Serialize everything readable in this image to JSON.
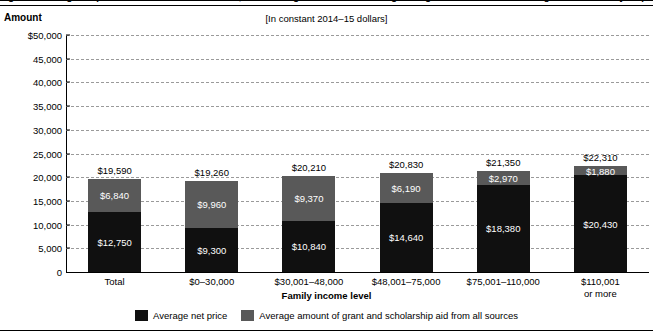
{
  "figure": {
    "title": "Figure 1. Average net price of attendance for first-time, full-time degree/certificate-seeking undergraduate students receiving Title IV aid at 4-year public postsecondary institutions, by family income level: Academic year 2013–14",
    "subtitle": "[In constant 2014–15 dollars]",
    "amount_axis_label": "Amount"
  },
  "chart_data": {
    "type": "bar",
    "stacked": true,
    "title": "Figure 1. Average net price of attendance for first-time, full-time degree/certificate-seeking undergraduate students receiving Title IV aid at 4-year public postsecondary institutions, by family income level: Academic year 2013–14",
    "subtitle": "[In constant 2014–15 dollars]",
    "xlabel": "Family income level",
    "ylabel": "Amount",
    "ylim": [
      0,
      50000
    ],
    "ytick_labels": [
      "$50,000",
      "45,000",
      "40,000",
      "35,000",
      "30,000",
      "25,000",
      "20,000",
      "15,000",
      "10,000",
      "5,000",
      "0"
    ],
    "ytick_values": [
      50000,
      45000,
      40000,
      35000,
      30000,
      25000,
      20000,
      15000,
      10000,
      5000,
      0
    ],
    "grid": true,
    "grid_style": "dashed",
    "legend_position": "bottom",
    "categories": [
      "Total",
      "$0–30,000",
      "$30,001–48,000",
      "$48,001–75,000",
      "$75,001–110,000",
      "$110,001\nor more"
    ],
    "series": [
      {
        "name": "Average net price",
        "color": "#101010",
        "values": [
          12750,
          9300,
          10840,
          14640,
          18380,
          20430
        ],
        "value_labels": [
          "$12,750",
          "$9,300",
          "$10,840",
          "$14,640",
          "$18,380",
          "$20,430"
        ]
      },
      {
        "name": "Average amount of grant and scholarship aid from all sources",
        "color": "#595959",
        "values": [
          6840,
          9960,
          9370,
          6190,
          2970,
          1880
        ],
        "value_labels": [
          "$6,840",
          "$9,960",
          "$9,370",
          "$6,190",
          "$2,970",
          "$1,880"
        ]
      }
    ],
    "totals": [
      19590,
      19260,
      20210,
      20830,
      21350,
      22310
    ],
    "total_labels": [
      "$19,590",
      "$19,260",
      "$20,210",
      "$20,830",
      "$21,350",
      "$22,310"
    ]
  },
  "bars": [
    {
      "category_line1": "Total",
      "category_line2": "",
      "total_label": "$19,590",
      "aid_label": "$6,840",
      "net_label": "$12,750",
      "total": 19590,
      "aid": 6840,
      "net": 12750
    },
    {
      "category_line1": "$0–30,000",
      "category_line2": "",
      "total_label": "$19,260",
      "aid_label": "$9,960",
      "net_label": "$9,300",
      "total": 19260,
      "aid": 9960,
      "net": 9300
    },
    {
      "category_line1": "$30,001–48,000",
      "category_line2": "",
      "total_label": "$20,210",
      "aid_label": "$9,370",
      "net_label": "$10,840",
      "total": 20210,
      "aid": 9370,
      "net": 10840
    },
    {
      "category_line1": "$48,001–75,000",
      "category_line2": "",
      "total_label": "$20,830",
      "aid_label": "$6,190",
      "net_label": "$14,640",
      "total": 20830,
      "aid": 6190,
      "net": 14640
    },
    {
      "category_line1": "$75,001–110,000",
      "category_line2": "",
      "total_label": "$21,350",
      "aid_label": "$2,970",
      "net_label": "$18,380",
      "total": 21350,
      "aid": 2970,
      "net": 18380
    },
    {
      "category_line1": "$110,001",
      "category_line2": "or more",
      "total_label": "$22,310",
      "aid_label": "$1,880",
      "net_label": "$20,430",
      "total": 22310,
      "aid": 1880,
      "net": 20430
    }
  ],
  "legend": {
    "items": [
      {
        "label": "Average net price",
        "color": "#101010"
      },
      {
        "label": "Average amount of grant and scholarship aid from all sources",
        "color": "#595959"
      }
    ]
  }
}
